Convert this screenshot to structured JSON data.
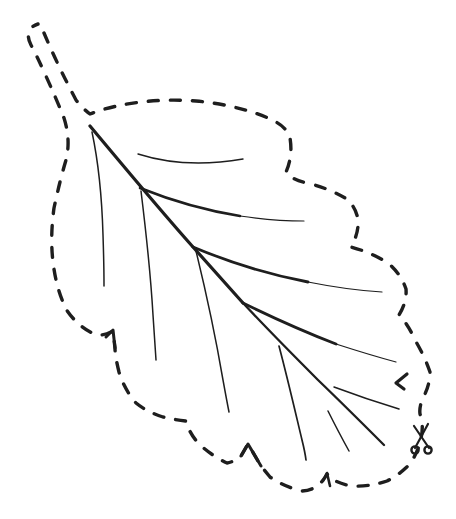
{
  "page": {
    "background_color": "#ffffff",
    "ink_color": "#1e1e1e"
  },
  "drawing": {
    "width": 456,
    "height": 519,
    "cut_outline": {
      "style": "dashed",
      "dash_pattern": "10 12",
      "stroke_width": 3.4,
      "path": "M 44 33 Q 58 66 76 100 Q 82 108 90 114 C 118 103 158 98 196 101 C 228 104 258 112 276 122 Q 287 128 290 138 Q 293 156 286 172 Q 293 181 308 183 Q 330 189 345 198 Q 356 206 358 220 Q 359 233 351 247 Q 370 252 388 263 Q 401 274 406 289 Q 407 302 399 315 Q 408 324 415 340 Q 425 357 430 372 Q 430 385 423 398 Q 419 407 420 414 Q 424 425 421 438 Q 418 453 409 465 Q 399 475 387 481 Q 369 487 352 486 Q 340 484 332 479 L 327 474 Q 318 491 301 491 Q 283 486 270 477 L 261 466 L 248 444 L 241 456 Q 234 462 227 463 Q 212 456 199 444 Q 189 433 186 421 Q 176 420 163 417 Q 147 412 136 403 Q 124 389 119 372 Q 115 356 115 348 L 113 331 Q 103 337 94 334 Q 77 326 66 309 Q 56 288 53 262 Q 50 237 54 208 Q 60 180 66 160 Q 71 140 64 118 Q 56 98 45 74 Q 37 56 31 45 C 26 36 28 27 38 24"
    },
    "notch_marks": [
      {
        "name": "notch-mark-left",
        "path": "M 106 337 L 113 330 L 115 348",
        "stroke_width": 3
      },
      {
        "name": "notch-mark-right-arrow",
        "path": "M 407 374 L 396 383 L 404 389",
        "stroke_width": 3.2
      },
      {
        "name": "notch-mark-bottom-caret",
        "path": "M 241 456 L 248 444 L 261 466",
        "stroke_width": 3
      },
      {
        "name": "notch-mark-bottom-tick",
        "path": "M 323 481 L 327 473 L 330 486",
        "stroke_width": 2.6
      }
    ],
    "veins": [
      {
        "name": "midrib-upper",
        "path": "M 90 126 C 125 168 160 210 193 247 C 210 266 227 285 243 303",
        "stroke_width": 3.2
      },
      {
        "name": "midrib-lower",
        "path": "M 243 303 C 270 332 296 358 318 380 C 343 404 366 427 384 445",
        "stroke_width": 2.3
      },
      {
        "name": "vein-top-small",
        "path": "M 138 154 Q 185 169 243 159",
        "stroke_width": 1.4
      },
      {
        "name": "vein-right-1-thick",
        "path": "M 140 188 Q 190 208 240 216",
        "stroke_width": 2.6
      },
      {
        "name": "vein-right-1-tip",
        "path": "M 240 216 Q 275 221 304 221",
        "stroke_width": 1.2
      },
      {
        "name": "vein-right-2-thick",
        "path": "M 193 247 Q 250 271 308 282",
        "stroke_width": 2.8
      },
      {
        "name": "vein-right-2-tip",
        "path": "M 308 282 Q 348 290 382 292",
        "stroke_width": 1.2
      },
      {
        "name": "vein-right-3-thick",
        "path": "M 243 303 Q 292 327 336 344",
        "stroke_width": 2.8
      },
      {
        "name": "vein-right-3-tip",
        "path": "M 336 344 Q 370 355 396 362",
        "stroke_width": 1.2
      },
      {
        "name": "vein-right-4",
        "path": "M 334 387 Q 366 399 399 409",
        "stroke_width": 1.5
      },
      {
        "name": "vein-left-1",
        "path": "M 92 132 C 99 165 102 200 103 235 Q 104 265 104 286",
        "stroke_width": 1.5
      },
      {
        "name": "vein-left-2",
        "path": "M 141 191 C 147 240 151 280 153 315 Q 155 345 156 360",
        "stroke_width": 1.5
      },
      {
        "name": "vein-left-3",
        "path": "M 196 251 C 208 300 217 345 223 380 Q 227 402 229 412",
        "stroke_width": 1.5
      },
      {
        "name": "vein-left-4",
        "path": "M 279 346 C 288 380 296 415 302 440 Q 305 452 306 460",
        "stroke_width": 1.7
      },
      {
        "name": "vein-small-bottom",
        "path": "M 328 411 Q 339 433 349 451",
        "stroke_width": 1.5
      }
    ],
    "scissors": {
      "blade_lines": [
        {
          "path": "M 414 426 L 429 448"
        },
        {
          "path": "M 428 424 L 415 448"
        }
      ],
      "blade_stroke_width": 2.2,
      "handles": [
        {
          "cx": 415,
          "cy": 450,
          "r": 3.6
        },
        {
          "cx": 428,
          "cy": 450,
          "r": 3.6
        }
      ],
      "handle_stroke_width": 2.4
    }
  }
}
